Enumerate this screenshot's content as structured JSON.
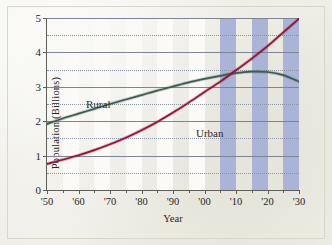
{
  "chart_data": {
    "type": "line",
    "title": "",
    "xlabel": "Year",
    "ylabel": "Population (Billions)",
    "xlim": [
      1950,
      2030
    ],
    "ylim": [
      0,
      5
    ],
    "grid": true,
    "legend_position": "inline-annotation",
    "y_ticks": [
      "0",
      "1",
      "2",
      "3",
      "4",
      "5"
    ],
    "y_tick_values": [
      0,
      1,
      2,
      3,
      4,
      5
    ],
    "y_minor_gridlines": [
      0.5,
      1.5,
      2.5,
      3.5,
      4.5
    ],
    "x_ticks": [
      "'50",
      "'60",
      "'70",
      "'80",
      "'90",
      "'00",
      "'10",
      "'20",
      "'30"
    ],
    "x_tick_values": [
      1950,
      1960,
      1970,
      1980,
      1990,
      2000,
      2010,
      2020,
      2030
    ],
    "x_minor_tick_values": [
      1955,
      1965,
      1975,
      1985,
      1995,
      2005,
      2015,
      2025
    ],
    "x": [
      1950,
      1955,
      1960,
      1965,
      1970,
      1975,
      1980,
      1985,
      1990,
      1995,
      2000,
      2005,
      2010,
      2015,
      2020,
      2025,
      2030
    ],
    "series": [
      {
        "name": "Rural",
        "color": "#3c5c52",
        "values": [
          1.92,
          2.08,
          2.22,
          2.36,
          2.5,
          2.63,
          2.76,
          2.89,
          3.01,
          3.13,
          3.23,
          3.32,
          3.4,
          3.44,
          3.43,
          3.34,
          3.15
        ]
      },
      {
        "name": "Urban",
        "color": "#8e1538",
        "values": [
          0.76,
          0.88,
          1.01,
          1.16,
          1.33,
          1.52,
          1.74,
          1.98,
          2.25,
          2.54,
          2.85,
          3.15,
          3.48,
          3.82,
          4.18,
          4.58,
          4.98
        ]
      }
    ],
    "shaded_bands": {
      "label": "projection-bands",
      "color": "#a9b4d6",
      "ranges": [
        [
          2005,
          2010
        ],
        [
          2015,
          2020
        ],
        [
          2025,
          2030
        ]
      ]
    },
    "alternating_bands": {
      "color": "#fbfaf6",
      "ranges": [
        [
          1955,
          1960
        ],
        [
          1965,
          1970
        ],
        [
          1975,
          1980
        ],
        [
          1985,
          1990
        ],
        [
          1995,
          2000
        ]
      ]
    },
    "annotations": [
      {
        "text": "Rural",
        "near_year": 1972,
        "near_value": 2.95
      },
      {
        "text": "Urban",
        "near_year": 1995,
        "near_value": 2.15
      }
    ]
  }
}
